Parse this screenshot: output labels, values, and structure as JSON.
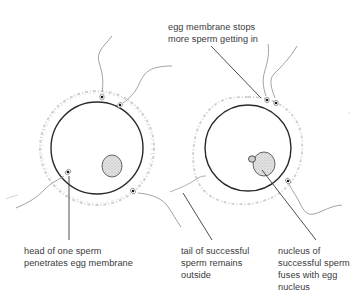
{
  "diagram": {
    "labels": {
      "top": "egg membrane stops\nmore sperm getting in",
      "head": "head of one sperm\npenetrates egg membrane",
      "tail": "tail of successful\nsperm remains\noutside",
      "nucleus": "nucleus of\nsuccessful sperm\nfuses with egg\nnucleus"
    },
    "colors": {
      "membrane": "#2a2a2a",
      "jelly_coat": "#c8c8c8",
      "sperm_tail": "#8a8a8a",
      "leader_line": "#3a3a3a",
      "nucleus_fill": "#d9d9d9",
      "text": "#3a3a3a"
    },
    "eggs": [
      {
        "name": "egg-before-fusion",
        "cx": 97,
        "cy": 148,
        "r": 46,
        "coat_r": 57,
        "nucleus": {
          "cx": 112,
          "cy": 166,
          "r": 10
        }
      },
      {
        "name": "egg-after-fusion",
        "cx": 248,
        "cy": 148,
        "r": 43,
        "coat_r": 53,
        "nucleus": {
          "cx": 263,
          "cy": 165,
          "r": 11
        }
      }
    ]
  }
}
